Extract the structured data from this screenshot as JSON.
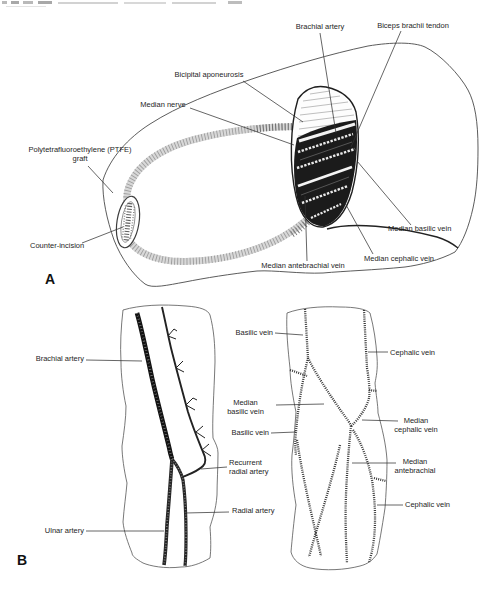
{
  "figure": {
    "panel_a": {
      "letter": "A",
      "labels": {
        "brachial_artery": "Brachial artery",
        "biceps_brachii_tendon": "Biceps brachii tendon",
        "bicipital_aponeurosis": "Bicipital aponeurosis",
        "median_nerve": "Median nerve",
        "ptfe_graft": "Polytetrafluoroethylene (PTFE)\ngraft",
        "counter_incision": "Counter-incision",
        "median_basilic_vein": "Median basilic vein",
        "median_cephalic_vein": "Median cephalic vein",
        "median_antebrachial_vein": "Median antebrachial vein"
      }
    },
    "panel_b": {
      "letter": "B",
      "arterial_diagram_labels": {
        "brachial_artery": "Brachial artery",
        "ulnar_artery": "Ulnar artery",
        "recurrent_radial_artery": "Recurrent\nradial artery",
        "radial_artery": "Radial artery"
      },
      "venous_diagram_labels": {
        "basilic_vein_upper": "Basilic vein",
        "median_basilic_vein": "Median\nbasilic vein",
        "basilic_vein_lower": "Basilic vein",
        "cephalic_vein_upper": "Cephalic vein",
        "median_cephalic_vein": "Median\ncephalic vein",
        "median_antebrachial": "Median\nantebrachial",
        "cephalic_vein_lower": "Cephalic vein"
      }
    },
    "colors": {
      "ink": "#1e1e1e",
      "outline": "#4a4a4a",
      "paper": "#ffffff"
    }
  }
}
